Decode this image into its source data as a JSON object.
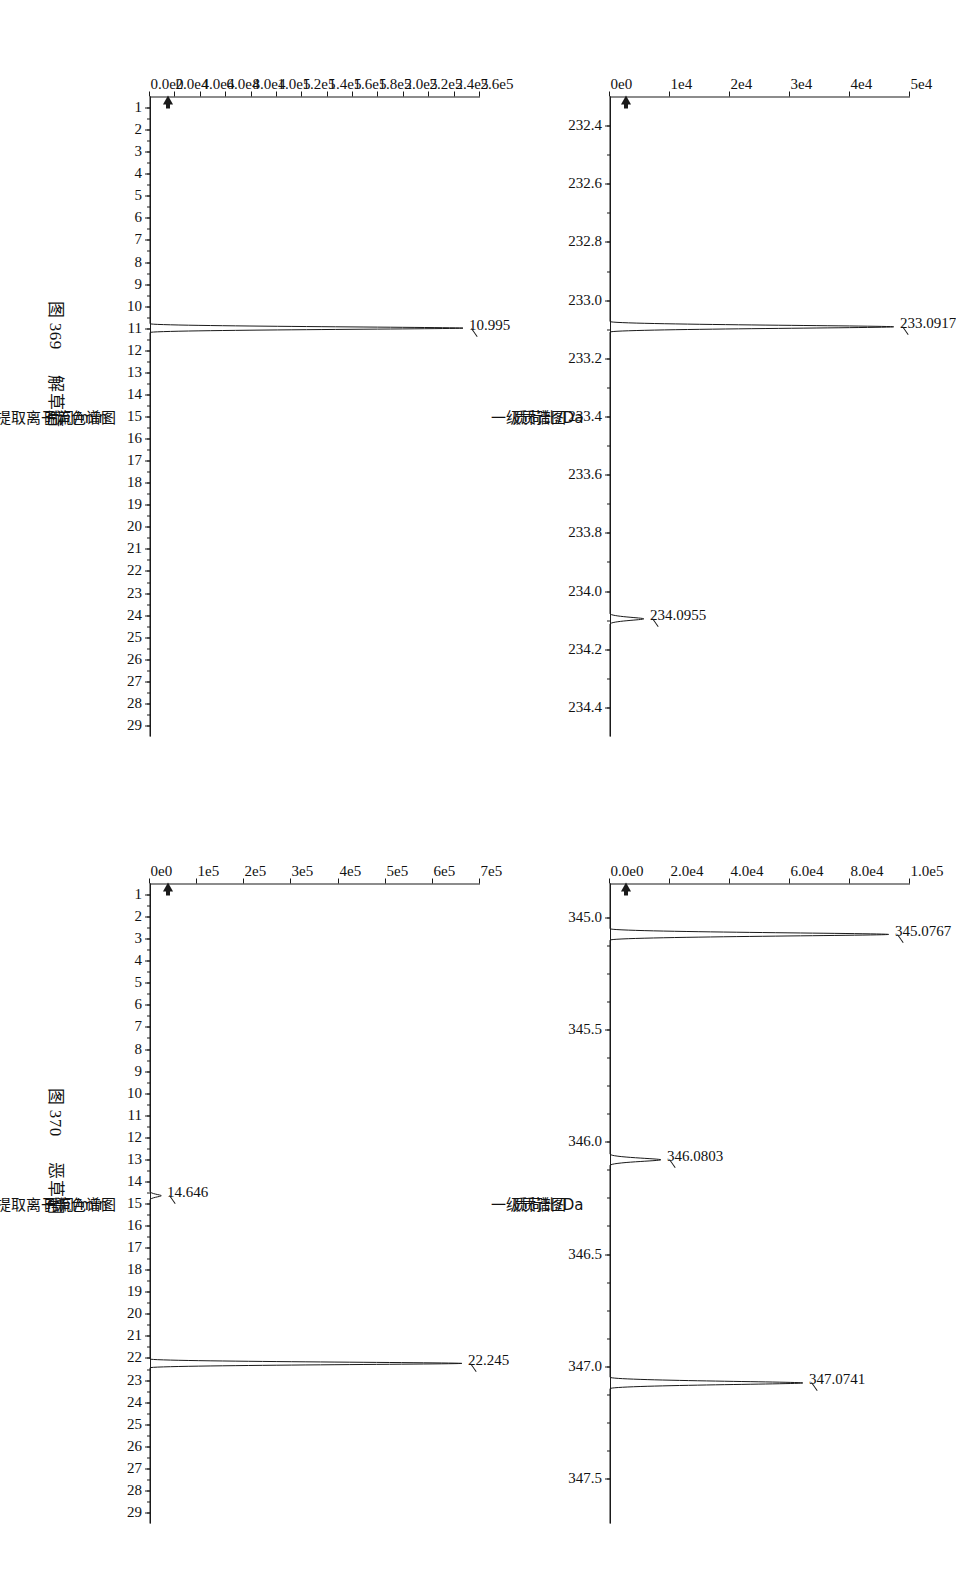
{
  "figures": [
    {
      "id": "fig-369",
      "caption_number": "图 369",
      "caption_name": "解草腈",
      "ms": {
        "title": "一级质谱图",
        "xlabel": "质荷比/Da",
        "xticks": [
          "232.4",
          "232.6",
          "232.8",
          "233.0",
          "233.2",
          "233.4",
          "233.6",
          "233.8",
          "234.0",
          "234.2",
          "234.4"
        ],
        "xlim": [
          232.3,
          234.5
        ],
        "yticks": [
          "0e0",
          "1e4",
          "2e4",
          "3e4",
          "4e4",
          "5e4"
        ],
        "ylim": [
          0,
          55000
        ],
        "peaks": [
          {
            "label": "233.0917",
            "mz": 233.0917,
            "intensity": 52000
          },
          {
            "label": "234.0955",
            "mz": 234.0955,
            "intensity": 6200
          }
        ]
      },
      "tic": {
        "title": "提取离子流色谱图",
        "xlabel": "时间/min",
        "xticks": [
          "1",
          "2",
          "3",
          "4",
          "5",
          "6",
          "7",
          "8",
          "9",
          "10",
          "11",
          "12",
          "13",
          "14",
          "15",
          "16",
          "17",
          "18",
          "19",
          "20",
          "21",
          "22",
          "23",
          "24",
          "25",
          "26",
          "27",
          "28",
          "29"
        ],
        "xlim": [
          0.5,
          29.5
        ],
        "yticks": [
          "0.0e0",
          "2.0e4",
          "4.0e4",
          "6.0e4",
          "8.0e4",
          "1.0e5",
          "1.2e5",
          "1.4e5",
          "1.6e5",
          "1.8e5",
          "2.0e5",
          "2.2e5",
          "2.4e5",
          "2.6e5"
        ],
        "ylim": [
          0,
          272000
        ],
        "peaks": [
          {
            "label": "10.995",
            "rt": 10.995,
            "intensity": 258000
          }
        ]
      }
    },
    {
      "id": "fig-370",
      "caption_number": "图 370",
      "caption_name": "恶草酮",
      "ms": {
        "title": "一级质谱图",
        "xlabel": "质荷比/Da",
        "xticks": [
          "345.0",
          "345.5",
          "346.0",
          "346.5",
          "347.0",
          "347.5"
        ],
        "xlim": [
          344.85,
          347.7
        ],
        "yticks": [
          "0.0e0",
          "2.0e4",
          "4.0e4",
          "6.0e4",
          "8.0e4",
          "1.0e5"
        ],
        "ylim": [
          0,
          112000
        ],
        "peaks": [
          {
            "label": "345.0767",
            "mz": 345.0767,
            "intensity": 104000
          },
          {
            "label": "346.0803",
            "mz": 346.0803,
            "intensity": 19000
          },
          {
            "label": "347.0741",
            "mz": 347.0741,
            "intensity": 72000
          }
        ]
      },
      "tic": {
        "title": "提取离子流色谱图",
        "xlabel": "时间/min",
        "xticks": [
          "1",
          "2",
          "3",
          "4",
          "5",
          "6",
          "7",
          "8",
          "9",
          "10",
          "11",
          "12",
          "13",
          "14",
          "15",
          "16",
          "17",
          "18",
          "19",
          "20",
          "21",
          "22",
          "23",
          "24",
          "25",
          "26",
          "27",
          "28",
          "29"
        ],
        "xlim": [
          0.5,
          29.5
        ],
        "yticks": [
          "0e0",
          "1e5",
          "2e5",
          "3e5",
          "4e5",
          "5e5",
          "6e5",
          "7e5"
        ],
        "ylim": [
          0,
          760000
        ],
        "peaks": [
          {
            "label": "22.245",
            "rt": 22.245,
            "intensity": 718000
          },
          {
            "label": "14.646",
            "rt": 14.646,
            "intensity": 26000
          }
        ]
      }
    }
  ],
  "colors": {
    "ink": "#1a1a1a",
    "background": "#ffffff"
  }
}
